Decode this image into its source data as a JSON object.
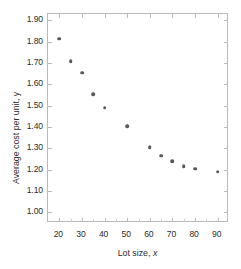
{
  "chart_data": {
    "type": "scatter",
    "title": "",
    "xlabel": "Lot size, x",
    "ylabel": "Average cost per unit, y",
    "xlim": [
      15,
      95
    ],
    "ylim": [
      0.95,
      1.93
    ],
    "xticks": [
      20,
      30,
      40,
      50,
      60,
      70,
      80,
      90
    ],
    "yticks": [
      "1.00",
      "1.10",
      "1.20",
      "1.30",
      "1.40",
      "1.50",
      "1.60",
      "1.70",
      "1.80",
      "1.90"
    ],
    "grid": false,
    "legend": false,
    "marker_color": "#58585a",
    "axis_color": "#b9b9b9",
    "x": [
      20,
      25,
      30,
      35,
      40,
      50,
      60,
      65,
      70,
      75,
      80,
      90
    ],
    "y": [
      1.815,
      1.71,
      1.655,
      1.555,
      1.49,
      1.405,
      1.305,
      1.265,
      1.24,
      1.215,
      1.205,
      1.19
    ],
    "points": [
      {
        "x": 20,
        "y": 1.815
      },
      {
        "x": 25,
        "y": 1.71
      },
      {
        "x": 30,
        "y": 1.655
      },
      {
        "x": 35,
        "y": 1.555
      },
      {
        "x": 40,
        "y": 1.49
      },
      {
        "x": 50,
        "y": 1.405
      },
      {
        "x": 60,
        "y": 1.305
      },
      {
        "x": 65,
        "y": 1.265
      },
      {
        "x": 70,
        "y": 1.24
      },
      {
        "x": 75,
        "y": 1.215
      },
      {
        "x": 80,
        "y": 1.205
      },
      {
        "x": 90,
        "y": 1.19
      }
    ]
  },
  "axis_titles": {
    "x_prefix": "Lot size, ",
    "x_variable": "x",
    "y_prefix": "Average cost per unit, ",
    "y_variable": "y"
  }
}
